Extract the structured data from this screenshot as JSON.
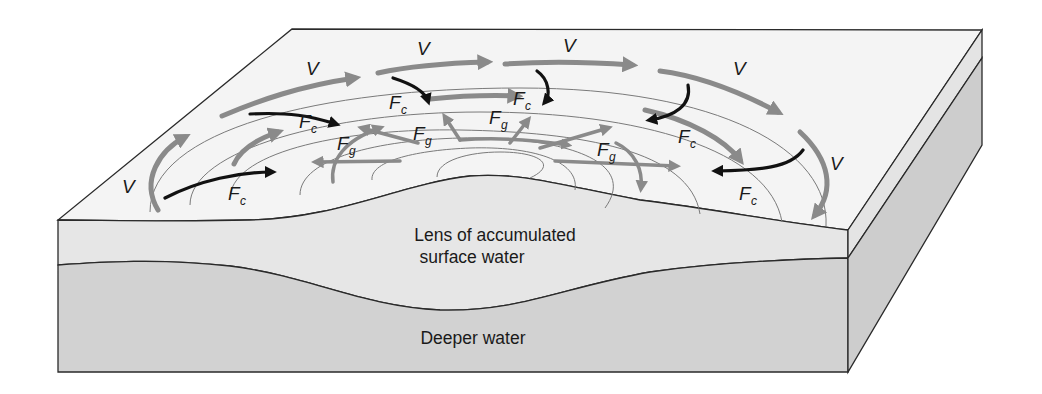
{
  "diagram": {
    "regions": {
      "lens_label_line1": "Lens of accumulated",
      "lens_label_line2": "surface water",
      "deep_label": "Deeper water"
    },
    "symbols": {
      "velocity": "V",
      "coriolis_main": "F",
      "coriolis_sub": "c",
      "gravity_main": "F",
      "gravity_sub": "g"
    },
    "legend_semantics": {
      "V": "current velocity (gray curved arrows, clockwise)",
      "Fc": "Coriolis force (black arrows, pointing inward/right of flow)",
      "Fg": "gravity / pressure-gradient force (gray arrows, pointing outward down slope)"
    },
    "colors": {
      "surface_top": "#f4f4f4",
      "surface_layer_front": "#e6e6e6",
      "deep_layer_front": "#d2d2d2",
      "side_upper": "#e4e4e4",
      "side_lower": "#cdcdcd",
      "velocity_arrow": "#8a8a8a",
      "gravity_arrow": "#8a8a8a",
      "coriolis_arrow": "#111111",
      "contour_line": "#7a7a7a",
      "edge_line": "#2a2a2a"
    }
  }
}
